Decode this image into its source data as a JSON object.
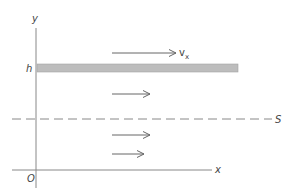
{
  "diagram": {
    "axis_y_label": "y",
    "axis_x_label": "x",
    "origin_label": "O",
    "plate_height_label": "h",
    "velocity_label": "v",
    "velocity_subscript": "x",
    "plane_label": "S",
    "colors": {
      "line": "#666666",
      "plate_fill": "#bdbdbd",
      "plate_stroke": "#9a9a9a"
    },
    "velocity_arrows_relative_lengths": [
      1.0,
      0.6,
      0.6,
      0.5
    ]
  }
}
